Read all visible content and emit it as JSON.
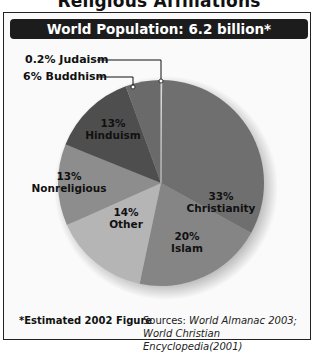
{
  "header": {
    "title": "Religious Affiliations",
    "banner": "World Population: 6.2 billion*"
  },
  "callouts": {
    "judaism": "0.2% Judaism",
    "buddhism": "6% Buddhism"
  },
  "slices": [
    {
      "pct": "33%",
      "name": "Christianity"
    },
    {
      "pct": "20%",
      "name": "Islam"
    },
    {
      "pct": "14%",
      "name": "Other"
    },
    {
      "pct": "13%",
      "name": "Nonreligious"
    },
    {
      "pct": "13%",
      "name": "Hinduism"
    }
  ],
  "footer": {
    "note": "*Estimated 2002 Figure",
    "sources_label": "Sources: ",
    "source1": "World Almanac 2003;",
    "source2": "World Christian Encyclopedia(2001)"
  },
  "colors": {
    "christianity": "#6f6f6f",
    "islam": "#858585",
    "other": "#b5b5b5",
    "nonreligious": "#8d8d8d",
    "hinduism": "#4e4e4e",
    "buddhism": "#6a6a6a",
    "judaism": "#d8d8d8",
    "banner": "#1c1c1c"
  },
  "chart_data": {
    "type": "pie",
    "title": "Religious Affiliations",
    "subtitle": "World Population: 6.2 billion*",
    "categories": [
      "Judaism",
      "Christianity",
      "Islam",
      "Other",
      "Nonreligious",
      "Hinduism",
      "Buddhism"
    ],
    "values": [
      0.2,
      33,
      20,
      14,
      13,
      13,
      6
    ],
    "unit": "%",
    "labeled_sum": 99.2,
    "note": "Labeled values sum to 99.2% as printed; not renormalized.",
    "drawn_boundary_angles_deg_clockwise_from_top": {
      "Judaism": [
        0,
        0.7
      ],
      "Christianity": [
        0.7,
        119
      ],
      "Islam": [
        119,
        192
      ],
      "Other": [
        192,
        246
      ],
      "Nonreligious": [
        246,
        292
      ],
      "Hinduism": [
        292,
        340
      ],
      "Buddhism": [
        340,
        360
      ]
    },
    "order": "clockwise from 12 o'clock",
    "footnote": "*Estimated 2002 Figure",
    "sources": "World Almanac 2003; World Christian Encyclopedia(2001)"
  }
}
